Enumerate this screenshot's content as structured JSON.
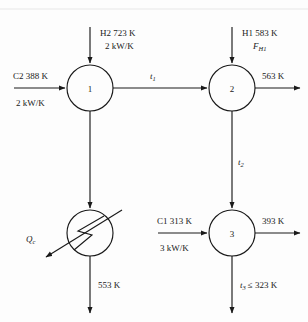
{
  "diagram": {
    "type": "process-flow-diagram",
    "background_color": "#fdfdfd",
    "line_color": "#1a1a1a",
    "units": [
      {
        "id": "1",
        "label": "1",
        "kind": "exchanger",
        "cx": 90,
        "cy": 88,
        "r": 23
      },
      {
        "id": "2",
        "label": "2",
        "kind": "exchanger",
        "cx": 232,
        "cy": 88,
        "r": 23
      },
      {
        "id": "3",
        "label": "3",
        "kind": "exchanger",
        "cx": 232,
        "cy": 233,
        "r": 23
      },
      {
        "id": "cooler",
        "label": "",
        "kind": "cooler",
        "cx": 90,
        "cy": 233,
        "r": 23
      }
    ],
    "labels": {
      "hot2_stream": "H2 723 K",
      "hot2_cp": "2 kW/K",
      "hot1_stream": "H1 583 K",
      "hot1_flow_sym": "F",
      "hot1_flow_sub": "H1",
      "cold2_stream": "C2 388 K",
      "cold2_cp": "2 kW/K",
      "cold1_stream": "C1 313 K",
      "cold1_cp": "3 kW/K",
      "t1_sym": "t",
      "t1_sub": "1",
      "t2_sym": "t",
      "t2_sub": "2",
      "t3_sym": "t",
      "t3_sub": "3",
      "t3_constraint": "≤ 323 K",
      "qc_sym": "Q",
      "qc_sub": "c",
      "out_unit2_temp": "563 K",
      "out_unit3_temp": "393 K",
      "out_cooler_temp": "553 K"
    }
  }
}
